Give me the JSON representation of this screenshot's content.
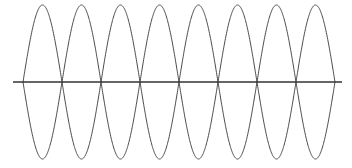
{
  "figure": {
    "background_color": "#ffffff",
    "width": 352,
    "height": 168,
    "title": "",
    "caption": ""
  },
  "axis": {
    "name": "horizontal-axis",
    "color": "#333333",
    "stroke_width": 1.6,
    "x_start": 13,
    "x_end": 342,
    "y": 82,
    "label": ""
  },
  "curves": {
    "color": "#4a4a4a",
    "stroke_width": 1.0,
    "amplitude_px": 77,
    "half_period_px": 39,
    "baseline_y": 82,
    "x_start": 23,
    "x_end": 335,
    "samples": 900
  },
  "chart_data": {
    "type": "line",
    "title": "",
    "subtitle": "",
    "xlabel": "",
    "ylabel": "",
    "grid": false,
    "legend_position": "none",
    "xlim": [
      0,
      8
    ],
    "ylim": [
      -1,
      1
    ],
    "x_tick_labels": [],
    "y_tick_labels": [],
    "annotations": [],
    "x_unit": "half-period",
    "zero_crossings": [
      0,
      1,
      2,
      3,
      4,
      5,
      6,
      7,
      8
    ],
    "zero_crossings_px": [
      23,
      62,
      101,
      140,
      179,
      218,
      257,
      296,
      335
    ],
    "peaks_px_x": [
      42,
      81,
      120,
      159,
      198,
      237,
      276,
      315
    ],
    "peaks_px_y": 5,
    "troughs_px_y": 162,
    "lens_count": 8,
    "series": [
      {
        "name": "sine",
        "formula": "y = sin(pi * x)",
        "amplitude": 1,
        "period": 2,
        "phase": 0,
        "x": [
          0,
          0.25,
          0.5,
          0.75,
          1,
          1.25,
          1.5,
          1.75,
          2,
          2.25,
          2.5,
          2.75,
          3,
          3.25,
          3.5,
          3.75,
          4,
          4.25,
          4.5,
          4.75,
          5,
          5.25,
          5.5,
          5.75,
          6,
          6.25,
          6.5,
          6.75,
          7,
          7.25,
          7.5,
          7.75,
          8
        ],
        "values": [
          0,
          0.707,
          1,
          0.707,
          0,
          -0.707,
          -1,
          -0.707,
          0,
          0.707,
          1,
          0.707,
          0,
          -0.707,
          -1,
          -0.707,
          0,
          0.707,
          1,
          0.707,
          0,
          -0.707,
          -1,
          -0.707,
          0,
          0.707,
          1,
          0.707,
          0,
          -0.707,
          -1,
          -0.707,
          0
        ]
      },
      {
        "name": "negative-sine",
        "formula": "y = -sin(pi * x)",
        "amplitude": 1,
        "period": 2,
        "phase": 3.14159,
        "x": [
          0,
          0.25,
          0.5,
          0.75,
          1,
          1.25,
          1.5,
          1.75,
          2,
          2.25,
          2.5,
          2.75,
          3,
          3.25,
          3.5,
          3.75,
          4,
          4.25,
          4.5,
          4.75,
          5,
          5.25,
          5.5,
          5.75,
          6,
          6.25,
          6.5,
          6.75,
          7,
          7.25,
          7.5,
          7.75,
          8
        ],
        "values": [
          0,
          -0.707,
          -1,
          -0.707,
          0,
          0.707,
          1,
          0.707,
          0,
          -0.707,
          -1,
          -0.707,
          0,
          0.707,
          1,
          0.707,
          0,
          -0.707,
          -1,
          -0.707,
          0,
          0.707,
          1,
          0.707,
          0,
          -0.707,
          -1,
          -0.707,
          0,
          0.707,
          1,
          0.707,
          0
        ]
      }
    ]
  }
}
